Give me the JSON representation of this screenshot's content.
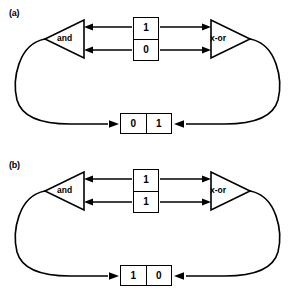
{
  "figure": {
    "panels": [
      {
        "id": "a",
        "label": "(a)",
        "left_gate": {
          "name": "and-gate",
          "label": "and",
          "orientation": "points-left"
        },
        "right_gate": {
          "name": "xor-gate",
          "label": "x-or",
          "orientation": "points-right"
        },
        "top_register": {
          "name": "top-register",
          "orientation": "vertical",
          "cells": [
            "1",
            "0"
          ]
        },
        "bottom_register": {
          "name": "bottom-register",
          "orientation": "horizontal",
          "cells": [
            "0",
            "1"
          ]
        },
        "arrows": [
          {
            "name": "arrow-top-to-and",
            "direction": "left"
          },
          {
            "name": "arrow-bottom-to-and",
            "direction": "left"
          },
          {
            "name": "arrow-top-to-xor",
            "direction": "right"
          },
          {
            "name": "arrow-bottom-to-xor",
            "direction": "right"
          },
          {
            "name": "arrow-left-loop-to-bottom-register",
            "direction": "right"
          },
          {
            "name": "arrow-right-loop-to-bottom-register",
            "direction": "left"
          }
        ]
      },
      {
        "id": "b",
        "label": "(b)",
        "left_gate": {
          "name": "and-gate",
          "label": "and",
          "orientation": "points-left"
        },
        "right_gate": {
          "name": "xor-gate",
          "label": "x-or",
          "orientation": "points-right"
        },
        "top_register": {
          "name": "top-register",
          "orientation": "vertical",
          "cells": [
            "1",
            "1"
          ]
        },
        "bottom_register": {
          "name": "bottom-register",
          "orientation": "horizontal",
          "cells": [
            "1",
            "0"
          ]
        },
        "arrows": [
          {
            "name": "arrow-top-to-and",
            "direction": "left"
          },
          {
            "name": "arrow-bottom-to-and",
            "direction": "left"
          },
          {
            "name": "arrow-top-to-xor",
            "direction": "right"
          },
          {
            "name": "arrow-bottom-to-xor",
            "direction": "right"
          },
          {
            "name": "arrow-left-loop-to-bottom-register",
            "direction": "right"
          },
          {
            "name": "arrow-right-loop-to-bottom-register",
            "direction": "left"
          }
        ]
      }
    ],
    "colors": {
      "stroke": "#000000",
      "background": "#ffffff"
    }
  }
}
